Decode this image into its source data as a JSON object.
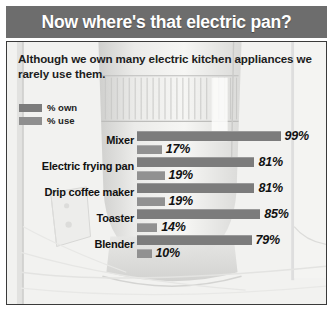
{
  "header": {
    "title": "Now where's that electric pan?"
  },
  "panel": {
    "subtitle": "Although we own many electric kitchen appliances we rarely use them."
  },
  "legend": {
    "items": [
      {
        "label": "% own",
        "key": "own",
        "color": "#7c7c7c"
      },
      {
        "label": "% use",
        "key": "use",
        "color": "#919191"
      }
    ]
  },
  "chart_data": {
    "type": "bar",
    "title": "Now where's that electric pan?",
    "subtitle": "Although we own many electric kitchen appliances we rarely use them.",
    "orientation": "horizontal",
    "grouped": true,
    "xlabel": "",
    "ylabel": "",
    "xlim": [
      0,
      100
    ],
    "grid": false,
    "legend_position": "top-left",
    "value_suffix": "%",
    "categories": [
      "Mixer",
      "Electric frying pan",
      "Drip coffee maker",
      "Toaster",
      "Blender"
    ],
    "series": [
      {
        "name": "% own",
        "color": "#7c7c7c",
        "values": [
          99,
          81,
          81,
          85,
          79
        ]
      },
      {
        "name": "% use",
        "color": "#919191",
        "values": [
          17,
          19,
          19,
          14,
          10
        ]
      }
    ],
    "rows": [
      {
        "category": "Mixer",
        "own": "99%",
        "use": "17%",
        "own_value": 99,
        "use_value": 17
      },
      {
        "category": "Electric frying pan",
        "own": "81%",
        "use": "19%",
        "own_value": 81,
        "use_value": 19
      },
      {
        "category": "Drip coffee maker",
        "own": "81%",
        "use": "19%",
        "own_value": 81,
        "use_value": 19
      },
      {
        "category": "Toaster",
        "own": "85%",
        "use": "14%",
        "own_value": 85,
        "use_value": 14
      },
      {
        "category": "Blender",
        "own": "79%",
        "use": "10%",
        "own_value": 79,
        "use_value": 10
      }
    ]
  },
  "colors": {
    "title_bar": "#6d6d6d",
    "panel_background": "#f2f2f0",
    "panel_border": "#3a3a3a",
    "bar_own": "#7c7c7c",
    "bar_use": "#919191",
    "text": "#111111"
  }
}
